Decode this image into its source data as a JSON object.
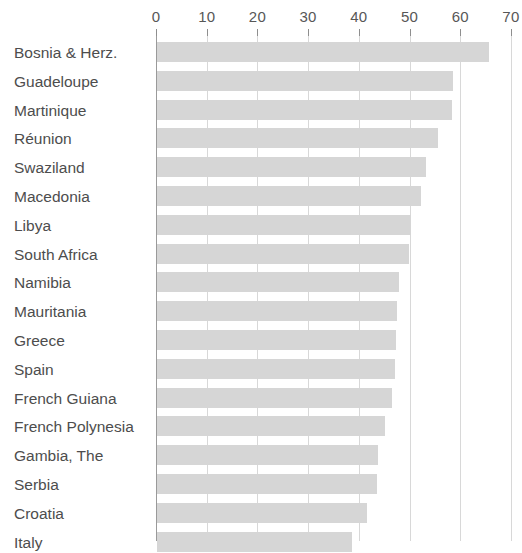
{
  "chart_data": {
    "type": "bar",
    "orientation": "horizontal",
    "title": "",
    "subtitle": "",
    "xlabel": "",
    "ylabel": "",
    "xlim": [
      0,
      70
    ],
    "xticks": [
      0,
      10,
      20,
      30,
      40,
      50,
      60,
      70
    ],
    "xtick_labels": [
      "0",
      "10",
      "20",
      "30",
      "40",
      "50",
      "60",
      "70"
    ],
    "grid": true,
    "legend": null,
    "bar_color": "#d6d6d6",
    "gridline_color": "#d8d8d8",
    "axis_color": "#9a9a9a",
    "label_color": "#4d4d4d",
    "categories": [
      "Bosnia & Herz.",
      "Guadeloupe",
      "Martinique",
      "Réunion",
      "Swaziland",
      "Macedonia",
      "Libya",
      "South Africa",
      "Namibia",
      "Mauritania",
      "Greece",
      "Spain",
      "French Guiana",
      "French Polynesia",
      "Gambia, The",
      "Serbia",
      "Croatia",
      "Italy"
    ],
    "values": [
      65.5,
      58.4,
      58.2,
      55.5,
      53.0,
      52.0,
      50.0,
      49.7,
      47.7,
      47.3,
      47.2,
      47.0,
      46.3,
      45.0,
      43.5,
      43.3,
      41.5,
      38.5
    ]
  }
}
